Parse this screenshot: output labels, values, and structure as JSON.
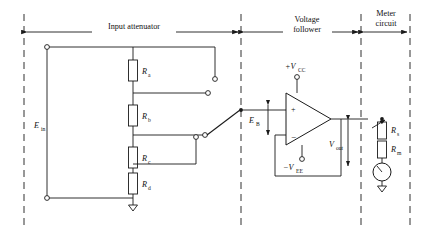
{
  "figure": {
    "type": "schematic-diagram",
    "line_color": "#1a1a1a",
    "background": "#ffffff"
  },
  "sections": [
    {
      "id": "input-attenuator",
      "label": "Input attenuator"
    },
    {
      "id": "voltage-follower",
      "label_line1": "Voltage",
      "label_line2": "follower"
    },
    {
      "id": "meter-circuit",
      "label_line1": "Meter",
      "label_line2": "circuit"
    }
  ],
  "labels": {
    "e_in": "E",
    "e_in_sub": "in",
    "e_b": "E",
    "e_b_sub": "B",
    "v_out": "V",
    "v_out_sub": "out",
    "vcc": "+V",
    "vcc_sub": "CC",
    "vee": "−V",
    "vee_sub": "EE",
    "opamp_plus": "+",
    "opamp_minus": "−"
  },
  "resistors": [
    {
      "id": "Ra",
      "letter": "R",
      "sub": "a"
    },
    {
      "id": "Rb",
      "letter": "R",
      "sub": "b"
    },
    {
      "id": "Rc",
      "letter": "R",
      "sub": "c"
    },
    {
      "id": "Rd",
      "letter": "R",
      "sub": "d"
    },
    {
      "id": "Rs",
      "letter": "R",
      "sub": "s",
      "variable": true
    },
    {
      "id": "Rm",
      "letter": "R",
      "sub": "m",
      "variable": false
    }
  ],
  "components": {
    "opamp": "op-amp-triangle",
    "meter": "moving-coil-meter",
    "switch": "rotary-range-switch",
    "grounds": 3,
    "terminals": 6
  }
}
